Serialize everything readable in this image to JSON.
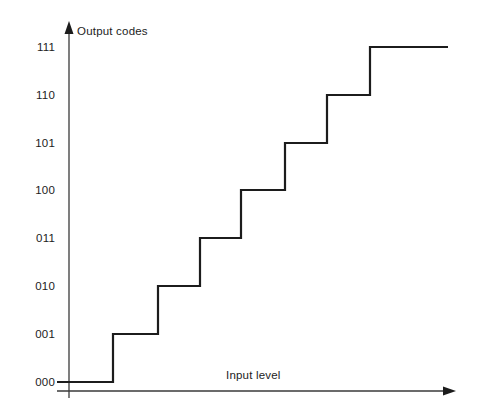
{
  "figure": {
    "name": "adc-quantization-staircase",
    "background_color": "#ffffff",
    "line_color": "#1c1c1c",
    "axis_color": "#3a3a3a"
  },
  "axes": {
    "y_axis": {
      "title": "Output codes",
      "arrow": "up-arrow",
      "x_px": 69,
      "top_px": 22,
      "bottom_px": 398
    },
    "x_axis": {
      "title": "Input level",
      "arrow": "right-arrow",
      "y_px": 391,
      "left_px": 57,
      "right_px": 455
    }
  },
  "chart_data": {
    "type": "line",
    "title": "",
    "subtitle": "",
    "xlabel": "Input level",
    "ylabel": "Output codes",
    "grid": false,
    "legend": null,
    "step_shape": "staircase",
    "categories": [
      "000",
      "001",
      "010",
      "011",
      "100",
      "101",
      "110",
      "111"
    ],
    "ytick_labels": [
      "000",
      "001",
      "010",
      "011",
      "100",
      "101",
      "110",
      "111"
    ],
    "ytick_values": [
      0,
      1,
      2,
      3,
      4,
      5,
      6,
      7
    ],
    "ylim": [
      0,
      7
    ],
    "xtick_labels": [],
    "x": [
      0,
      1,
      2,
      3,
      4,
      5,
      6,
      7
    ],
    "values": [
      0,
      1,
      2,
      3,
      4,
      5,
      6,
      7
    ],
    "series": [
      {
        "name": "ideal ADC transfer function",
        "values": [
          0,
          1,
          2,
          3,
          4,
          5,
          6,
          7
        ]
      }
    ],
    "steps": [
      {
        "code": "000",
        "level": 0,
        "x_start_px": 57,
        "x_end_px": 113,
        "y_px": 382
      },
      {
        "code": "001",
        "level": 1,
        "x_start_px": 113,
        "x_end_px": 158,
        "y_px": 334
      },
      {
        "code": "010",
        "level": 2,
        "x_start_px": 158,
        "x_end_px": 200,
        "y_px": 286
      },
      {
        "code": "011",
        "level": 3,
        "x_start_px": 200,
        "x_end_px": 241,
        "y_px": 238
      },
      {
        "code": "100",
        "level": 4,
        "x_start_px": 241,
        "x_end_px": 285,
        "y_px": 190
      },
      {
        "code": "101",
        "level": 5,
        "x_start_px": 285,
        "x_end_px": 327,
        "y_px": 143
      },
      {
        "code": "110",
        "level": 6,
        "x_start_px": 327,
        "x_end_px": 370,
        "y_px": 95
      },
      {
        "code": "111",
        "level": 7,
        "x_start_px": 370,
        "x_end_px": 448,
        "y_px": 47
      }
    ]
  },
  "tick_labels": [
    {
      "text": "111",
      "y_px": 41
    },
    {
      "text": "110",
      "y_px": 89
    },
    {
      "text": "101",
      "y_px": 137
    },
    {
      "text": "100",
      "y_px": 184
    },
    {
      "text": "011",
      "y_px": 232
    },
    {
      "text": "010",
      "y_px": 280
    },
    {
      "text": "001",
      "y_px": 328
    },
    {
      "text": "000",
      "y_px": 376
    }
  ]
}
